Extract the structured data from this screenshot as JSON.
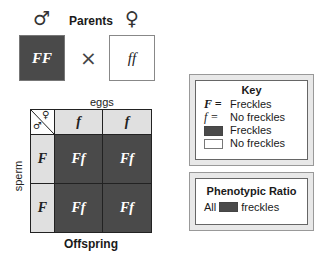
{
  "parents": {
    "title": "Parents",
    "male_symbol": "♂",
    "female_symbol": "♀",
    "male_genotype": "FF",
    "female_genotype": "ff",
    "cross_symbol": "×"
  },
  "punnett": {
    "top_label": "eggs",
    "side_label": "sperm",
    "bottom_label": "Offspring",
    "corner_female": "♀",
    "corner_male": "♂",
    "columns": [
      "f",
      "f"
    ],
    "rows": [
      {
        "allele": "F",
        "cells": [
          "Ff",
          "Ff"
        ]
      },
      {
        "allele": "F",
        "cells": [
          "Ff",
          "Ff"
        ]
      }
    ]
  },
  "key": {
    "title": "Key",
    "entries": [
      {
        "symbol": "F =",
        "label": "Freckles"
      },
      {
        "symbol": "f =",
        "label": "No freckles"
      },
      {
        "swatch": "dark",
        "label": "Freckles"
      },
      {
        "swatch": "light",
        "label": "No freckles"
      }
    ]
  },
  "ratio": {
    "title": "Phenotypic Ratio",
    "prefix": "All",
    "suffix": "freckles"
  },
  "colors": {
    "dominant_fill": "#4a4a4a",
    "header_fill": "#e0e0e0",
    "frame_fill": "#e8e8e8"
  }
}
